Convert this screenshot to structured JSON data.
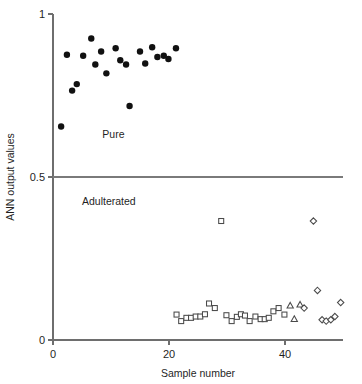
{
  "chart_data": {
    "type": "scatter",
    "title": "",
    "xlabel": "Sample number",
    "ylabel": "ANN output values",
    "xlim": [
      0,
      50
    ],
    "ylim": [
      0,
      1
    ],
    "xticks": [
      0,
      20,
      40
    ],
    "xticklabels": [
      "0",
      "20",
      "40"
    ],
    "yticks": [
      0,
      0.5,
      1
    ],
    "yticklabels": [
      "0",
      "0.5",
      "1"
    ],
    "grid": false,
    "legend": "none",
    "annotations": [
      {
        "text": "Pure",
        "x": 8.5,
        "y": 0.62
      },
      {
        "text": "Adulterated",
        "x": 5.0,
        "y": 0.415
      }
    ],
    "threshold_line": {
      "y": 0.5,
      "label": "decision threshold"
    },
    "series": [
      {
        "name": "Pure samples",
        "marker": "filled-circle",
        "points": [
          {
            "x": 1.4,
            "y": 0.655
          },
          {
            "x": 2.4,
            "y": 0.875
          },
          {
            "x": 3.3,
            "y": 0.765
          },
          {
            "x": 4.1,
            "y": 0.785
          },
          {
            "x": 5.2,
            "y": 0.872
          },
          {
            "x": 6.6,
            "y": 0.925
          },
          {
            "x": 7.3,
            "y": 0.845
          },
          {
            "x": 8.3,
            "y": 0.885
          },
          {
            "x": 9.2,
            "y": 0.818
          },
          {
            "x": 10.8,
            "y": 0.895
          },
          {
            "x": 11.6,
            "y": 0.858
          },
          {
            "x": 12.6,
            "y": 0.845
          },
          {
            "x": 13.2,
            "y": 0.718
          },
          {
            "x": 15.0,
            "y": 0.885
          },
          {
            "x": 15.9,
            "y": 0.848
          },
          {
            "x": 17.1,
            "y": 0.898
          },
          {
            "x": 18.0,
            "y": 0.868
          },
          {
            "x": 19.1,
            "y": 0.872
          },
          {
            "x": 19.9,
            "y": 0.862
          },
          {
            "x": 21.2,
            "y": 0.895
          }
        ]
      },
      {
        "name": "Adulterated - square group",
        "marker": "open-square",
        "points": [
          {
            "x": 21.3,
            "y": 0.078
          },
          {
            "x": 22.1,
            "y": 0.058
          },
          {
            "x": 23.0,
            "y": 0.068
          },
          {
            "x": 23.8,
            "y": 0.068
          },
          {
            "x": 24.6,
            "y": 0.072
          },
          {
            "x": 25.4,
            "y": 0.072
          },
          {
            "x": 26.2,
            "y": 0.079
          },
          {
            "x": 26.9,
            "y": 0.112
          },
          {
            "x": 27.9,
            "y": 0.098
          },
          {
            "x": 29.0,
            "y": 0.365
          },
          {
            "x": 29.9,
            "y": 0.076
          },
          {
            "x": 30.8,
            "y": 0.058
          },
          {
            "x": 31.7,
            "y": 0.071
          },
          {
            "x": 32.4,
            "y": 0.079
          },
          {
            "x": 33.1,
            "y": 0.075
          },
          {
            "x": 33.9,
            "y": 0.058
          },
          {
            "x": 34.9,
            "y": 0.072
          },
          {
            "x": 35.8,
            "y": 0.064
          },
          {
            "x": 36.5,
            "y": 0.064
          },
          {
            "x": 37.2,
            "y": 0.068
          },
          {
            "x": 38.0,
            "y": 0.088
          },
          {
            "x": 38.9,
            "y": 0.098
          },
          {
            "x": 39.9,
            "y": 0.078
          }
        ]
      },
      {
        "name": "Adulterated - triangle group",
        "marker": "open-triangle",
        "points": [
          {
            "x": 40.9,
            "y": 0.105
          },
          {
            "x": 41.6,
            "y": 0.064
          },
          {
            "x": 42.6,
            "y": 0.108
          }
        ]
      },
      {
        "name": "Adulterated - diamond group",
        "marker": "open-diamond",
        "points": [
          {
            "x": 43.3,
            "y": 0.098
          },
          {
            "x": 44.9,
            "y": 0.365
          },
          {
            "x": 45.6,
            "y": 0.152
          },
          {
            "x": 46.4,
            "y": 0.062
          },
          {
            "x": 47.1,
            "y": 0.058
          },
          {
            "x": 47.9,
            "y": 0.062
          },
          {
            "x": 48.6,
            "y": 0.072
          },
          {
            "x": 49.6,
            "y": 0.115
          }
        ]
      }
    ]
  }
}
